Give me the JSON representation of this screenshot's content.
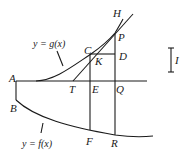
{
  "diagram": {
    "title": "",
    "curves": {
      "upper": {
        "equation": "y = g(x)"
      },
      "lower": {
        "equation": "y = f(x)"
      }
    },
    "points": {
      "A": "A",
      "B": "B",
      "C": "C",
      "D": "D",
      "E": "E",
      "F": "F",
      "H": "H",
      "K": "K",
      "P": "P",
      "Q": "Q",
      "R": "R",
      "T": "T"
    },
    "scale_bar_label": "I"
  }
}
